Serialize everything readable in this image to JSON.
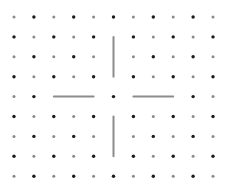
{
  "diagram": {
    "type": "dot-grid",
    "columns": 11,
    "rows": 9,
    "origin": {
      "x": 14,
      "y": 17
    },
    "spacing": 19.9,
    "dot_pattern": "checkerboard",
    "colors": {
      "background": "#ffffff",
      "dark_dot": "#1a1a1a",
      "light_dot": "#8a8a8a",
      "segment": "#8c8c8c"
    },
    "dot_radius": {
      "dark": 1.7,
      "light": 1.5
    },
    "hidden_dots": [
      [
        1,
        5
      ],
      [
        2,
        5
      ],
      [
        3,
        5
      ],
      [
        4,
        2
      ],
      [
        4,
        3
      ],
      [
        4,
        4
      ],
      [
        4,
        6
      ],
      [
        4,
        7
      ],
      [
        4,
        8
      ],
      [
        5,
        5
      ],
      [
        6,
        5
      ],
      [
        7,
        5
      ]
    ],
    "segments": [
      {
        "name": "top-vertical-segment",
        "from": {
          "row": 1,
          "col": 5
        },
        "to": {
          "row": 3,
          "col": 5
        }
      },
      {
        "name": "left-horizontal-segment",
        "from": {
          "row": 4,
          "col": 2
        },
        "to": {
          "row": 4,
          "col": 4
        }
      },
      {
        "name": "right-horizontal-segment",
        "from": {
          "row": 4,
          "col": 6
        },
        "to": {
          "row": 4,
          "col": 8
        }
      },
      {
        "name": "bottom-vertical-segment",
        "from": {
          "row": 5,
          "col": 5
        },
        "to": {
          "row": 7,
          "col": 5
        }
      }
    ]
  }
}
